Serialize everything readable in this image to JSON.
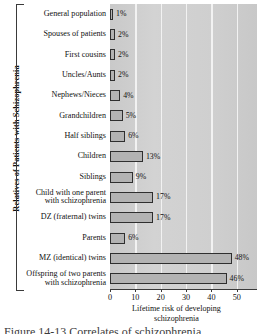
{
  "chart_data": {
    "type": "bar",
    "orientation": "horizontal",
    "title": "",
    "xlabel": "Lifetime risk of developing schizophrenia",
    "xlabel_lines": [
      "Lifetime risk of developing",
      "schizophrenia"
    ],
    "ylabel": "Relatives of Patients with Schizophrenia",
    "xlim": [
      0,
      58
    ],
    "xticks": [
      0,
      10,
      20,
      30,
      40,
      50
    ],
    "xtick_labels": [
      "0",
      "10",
      "20",
      "30",
      "40",
      "50"
    ],
    "grid": "vertical-white",
    "legend": "none",
    "value_suffix": "%",
    "categories": [
      "General population",
      "Spouses of patients",
      "First cousins",
      "Uncles/Aunts",
      "Nephews/Nieces",
      "Grandchildren",
      "Half siblings",
      "Children",
      "Siblings",
      "Child with one parent with schizophrenia",
      "DZ (fraternal) twins",
      "Parents",
      "MZ (identical) twins",
      "Offspring of two parents with schizophrenia"
    ],
    "category_lines": [
      [
        "General population"
      ],
      [
        "Spouses of patients"
      ],
      [
        "First cousins"
      ],
      [
        "Uncles/Aunts"
      ],
      [
        "Nephews/Nieces"
      ],
      [
        "Grandchildren"
      ],
      [
        "Half siblings"
      ],
      [
        "Children"
      ],
      [
        "Siblings"
      ],
      [
        "Child with one parent",
        "with schizophrenia"
      ],
      [
        "DZ (fraternal) twins"
      ],
      [
        "Parents"
      ],
      [
        "MZ (identical) twins"
      ],
      [
        "Offspring of two parents",
        "with schizophrenia"
      ]
    ],
    "values": [
      1,
      2,
      2,
      2,
      4,
      5,
      6,
      13,
      9,
      17,
      17,
      6,
      48,
      46
    ],
    "value_labels": [
      "1%",
      "2%",
      "2%",
      "2%",
      "4%",
      "5%",
      "6%",
      "13%",
      "9%",
      "17%",
      "17%",
      "6%",
      "48%",
      "46%"
    ]
  },
  "colors": {
    "bar_fill": "#b3b3b3",
    "bar_border": "#2f2f2f",
    "plot_background": "#cfcfcf",
    "gridline": "#f2f2f2",
    "axis": "#3a3a3a",
    "text": "#111111",
    "page_background": "#ffffff"
  },
  "caption": {
    "text": "Figure 14-13  Correlates of schizophrenia."
  }
}
